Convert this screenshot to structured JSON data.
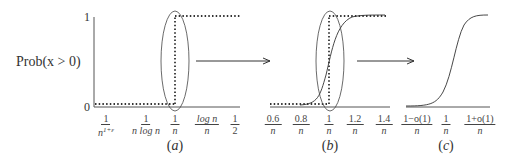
{
  "y_axis": {
    "label": "Prob(x > 0)",
    "tick_top": "1",
    "tick_bottom": "0"
  },
  "panels": [
    {
      "caption": "(a)",
      "x_ticks": [
        {
          "num": "1",
          "den": "n^{1+ε}"
        },
        {
          "num": "1",
          "den": "n log n"
        },
        {
          "num": "1",
          "den": "n"
        },
        {
          "num": "log n",
          "den": "n"
        },
        {
          "num": "1",
          "den": "2"
        }
      ],
      "description": "step function at 1/n (dotted), circled"
    },
    {
      "caption": "(b)",
      "x_ticks": [
        {
          "num": "0.6",
          "den": "n"
        },
        {
          "num": "0.8",
          "den": "n"
        },
        {
          "num": "1",
          "den": "n"
        },
        {
          "num": "1.2",
          "den": "n"
        },
        {
          "num": "1.4",
          "den": "n"
        }
      ],
      "description": "zoomed view: dotted step plus smooth sigmoid, circled"
    },
    {
      "caption": "(c)",
      "x_ticks": [
        {
          "num": "1−o(1)",
          "den": "n"
        },
        {
          "num": "1",
          "den": "n"
        },
        {
          "num": "1+o(1)",
          "den": "n"
        }
      ],
      "description": "smooth sigmoid transition"
    }
  ],
  "captions": {
    "a": "a",
    "b": "b",
    "c": "c"
  },
  "arrows": [
    "a-to-b",
    "b-to-c"
  ]
}
